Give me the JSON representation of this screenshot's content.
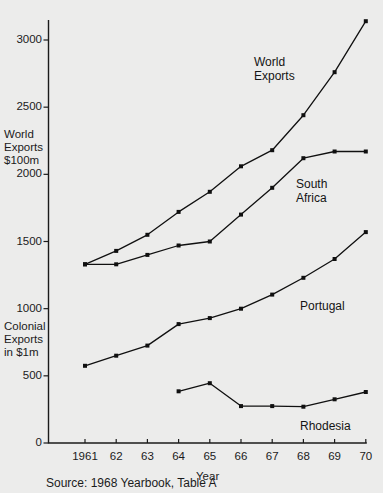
{
  "chart_data": {
    "type": "line",
    "title": "",
    "xlabel": "Year",
    "ylabel_left_upper": "World\nExports\n$100m",
    "ylabel_left_lower": "Colonial\nExports\nin $1m",
    "x": [
      1961,
      1962,
      1963,
      1964,
      1965,
      1966,
      1967,
      1968,
      1969,
      1970
    ],
    "xtick_labels": [
      "1961",
      "62",
      "63",
      "64",
      "65",
      "66",
      "67",
      "68",
      "69",
      "70"
    ],
    "ytick_labels": [
      "0",
      "500",
      "1000",
      "1500",
      "2000",
      "2500",
      "3000"
    ],
    "ytick_values": [
      0,
      500,
      1000,
      1500,
      2000,
      2500,
      3000
    ],
    "ylim": [
      0,
      3250
    ],
    "xlim": [
      1960.6,
      1970.4
    ],
    "grid": false,
    "legend_position": "inline-annotations",
    "series": [
      {
        "name": "World Exports",
        "label": "World\nExports",
        "x": [
          1961,
          1962,
          1963,
          1964,
          1965,
          1966,
          1967,
          1968,
          1969,
          1970
        ],
        "values": [
          1330,
          1430,
          1550,
          1720,
          1870,
          2060,
          2180,
          2440,
          2760,
          3140
        ]
      },
      {
        "name": "South Africa",
        "label": "South\nAfrica",
        "x": [
          1961,
          1962,
          1963,
          1964,
          1965,
          1966,
          1967,
          1968,
          1969,
          1970
        ],
        "values": [
          1330,
          1330,
          1400,
          1470,
          1500,
          1700,
          1900,
          2120,
          2170,
          2170
        ]
      },
      {
        "name": "Portugal",
        "label": "Portugal",
        "x": [
          1961,
          1962,
          1963,
          1964,
          1965,
          1966,
          1967,
          1968,
          1969,
          1970
        ],
        "values": [
          575,
          650,
          725,
          885,
          930,
          1000,
          1105,
          1230,
          1370,
          1570
        ]
      },
      {
        "name": "Rhodesia",
        "label": "Rhodesia",
        "x": [
          1964,
          1965,
          1966,
          1967,
          1968,
          1969,
          1970
        ],
        "values": [
          385,
          445,
          275,
          275,
          270,
          325,
          380
        ]
      }
    ],
    "annotations": [
      {
        "text": "World\nExports",
        "x_px": 254,
        "y_px": 56
      },
      {
        "text": "South\nAfrica",
        "x_px": 296,
        "y_px": 178
      },
      {
        "text": "Portugal",
        "x_px": 300,
        "y_px": 300
      },
      {
        "text": "Rhodesia",
        "x_px": 300,
        "y_px": 420
      }
    ],
    "source": "Source: 1968 Yearbook, Table A",
    "colors": {
      "background": "#ececeb",
      "ink": "#141414",
      "axis": "#1b1b1b"
    }
  }
}
